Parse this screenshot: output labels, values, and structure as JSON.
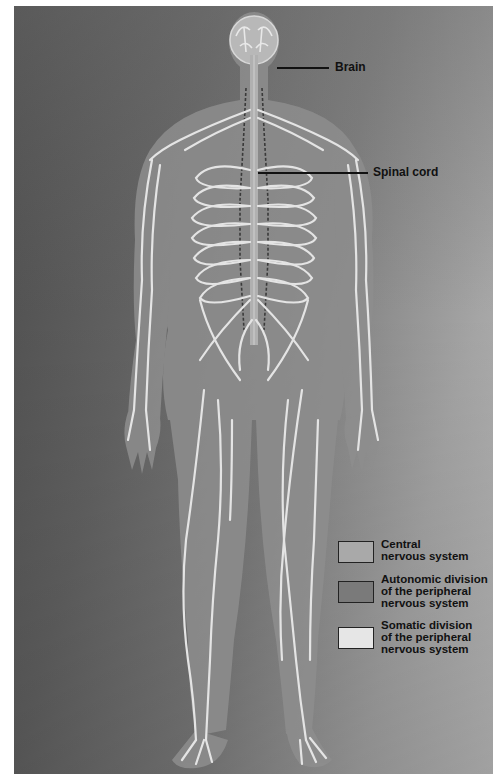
{
  "figure": {
    "colors": {
      "background_dark": "#4a4a4a",
      "background_light": "#bdbdbd",
      "body_silhouette": "#8c8c8c",
      "central_nervous_system": "#a9a9a9",
      "autonomic_division": "#7a7a7a",
      "somatic_division": "#e6e6e6"
    }
  },
  "labels": {
    "brain": "Brain",
    "spinal_cord": "Spinal cord"
  },
  "legend": {
    "items": [
      {
        "line1": "Central",
        "line2": "nervous system",
        "line3": "",
        "color": "#a9a9a9"
      },
      {
        "line1": "Autonomic division",
        "line2": "of the peripheral",
        "line3": "nervous system",
        "color": "#7a7a7a"
      },
      {
        "line1": "Somatic division",
        "line2": "of the peripheral",
        "line3": "nervous system",
        "color": "#e6e6e6"
      }
    ]
  }
}
